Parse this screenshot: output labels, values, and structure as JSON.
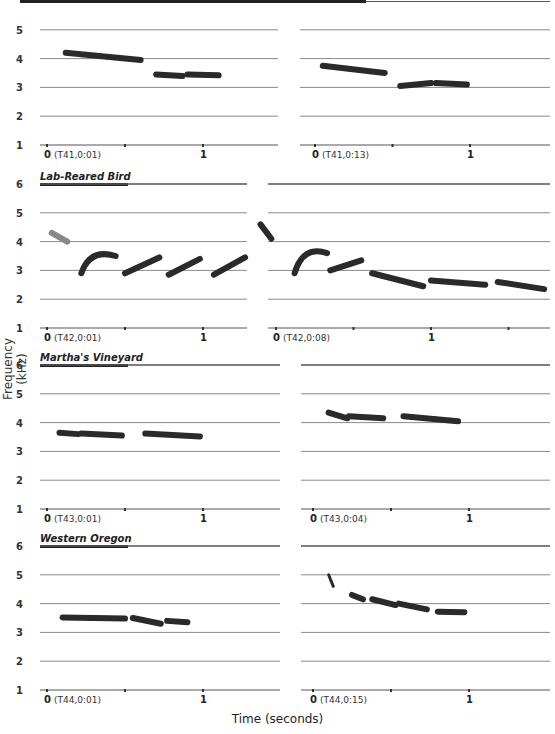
{
  "figure": {
    "ylabel": "Frequency (kHz)",
    "xlabel": "Time (seconds)",
    "colors": {
      "grid": "#8a8a8a",
      "note": "#2a2a2a",
      "header_bar": "#222222",
      "axis_line": "#555555"
    }
  },
  "chart_data": [
    {
      "type": "spectrogram",
      "row": 1,
      "group": "",
      "panels": [
        {
          "position": "left",
          "recording": "(T41,0:01)",
          "x_ticks": [
            "0",
            "1"
          ],
          "notes": [
            {
              "t0": 0.12,
              "t1": 0.6,
              "f0": 4.2,
              "f1": 3.95
            },
            {
              "t0": 0.7,
              "t1": 0.87,
              "f0": 3.45,
              "f1": 3.4
            },
            {
              "t0": 0.9,
              "t1": 1.1,
              "f0": 3.45,
              "f1": 3.42
            }
          ]
        },
        {
          "position": "right",
          "recording": "(T41,0:13)",
          "x_ticks": [
            "0",
            "1"
          ],
          "notes": [
            {
              "t0": 0.05,
              "t1": 0.45,
              "f0": 3.75,
              "f1": 3.5
            },
            {
              "t0": 0.55,
              "t1": 0.75,
              "f0": 3.05,
              "f1": 3.15
            },
            {
              "t0": 0.78,
              "t1": 0.98,
              "f0": 3.15,
              "f1": 3.1
            }
          ]
        }
      ],
      "y_ticks": [
        "1",
        "2",
        "3",
        "4",
        "5"
      ],
      "ylim": [
        1,
        6
      ]
    },
    {
      "type": "spectrogram",
      "row": 2,
      "group": "Lab-Reared Bird",
      "panels": [
        {
          "position": "left",
          "recording": "(T42,0:01)",
          "x_ticks": [
            "0",
            "1"
          ],
          "notes": [
            {
              "t0": 0.03,
              "t1": 0.13,
              "f0": 4.3,
              "f1": 4.0,
              "faint": true
            },
            {
              "t0": 0.22,
              "t1": 0.44,
              "f0": 2.9,
              "f1": 3.5,
              "arch": true
            },
            {
              "t0": 0.5,
              "t1": 0.72,
              "f0": 2.9,
              "f1": 3.45
            },
            {
              "t0": 0.78,
              "t1": 0.98,
              "f0": 2.85,
              "f1": 3.4
            },
            {
              "t0": 1.07,
              "t1": 1.27,
              "f0": 2.85,
              "f1": 3.45
            }
          ]
        },
        {
          "position": "right",
          "recording": "(T42,0:08)",
          "x_ticks": [
            "0",
            "1"
          ],
          "notes": [
            {
              "t0": -0.1,
              "t1": -0.03,
              "f0": 4.6,
              "f1": 4.1
            },
            {
              "t0": 0.12,
              "t1": 0.33,
              "f0": 2.9,
              "f1": 3.6,
              "arch": true
            },
            {
              "t0": 0.35,
              "t1": 0.55,
              "f0": 3.0,
              "f1": 3.35
            },
            {
              "t0": 0.62,
              "t1": 0.95,
              "f0": 2.9,
              "f1": 2.45
            },
            {
              "t0": 1.0,
              "t1": 1.35,
              "f0": 2.65,
              "f1": 2.5
            },
            {
              "t0": 1.43,
              "t1": 1.73,
              "f0": 2.6,
              "f1": 2.35
            }
          ]
        }
      ],
      "y_ticks": [
        "1",
        "2",
        "3",
        "4",
        "5",
        "6"
      ],
      "ylim": [
        1,
        6
      ]
    },
    {
      "type": "spectrogram",
      "row": 3,
      "group": "Martha's Vineyard",
      "panels": [
        {
          "position": "left",
          "recording": "(T43,0:01)",
          "x_ticks": [
            "0",
            "1"
          ],
          "notes": [
            {
              "t0": 0.08,
              "t1": 0.2,
              "f0": 3.65,
              "f1": 3.6
            },
            {
              "t0": 0.22,
              "t1": 0.48,
              "f0": 3.62,
              "f1": 3.55
            },
            {
              "t0": 0.63,
              "t1": 0.98,
              "f0": 3.62,
              "f1": 3.52
            }
          ]
        },
        {
          "position": "right",
          "recording": "(T43,0:04)",
          "x_ticks": [
            "0",
            "1"
          ],
          "notes": [
            {
              "t0": 0.1,
              "t1": 0.22,
              "f0": 4.35,
              "f1": 4.15
            },
            {
              "t0": 0.23,
              "t1": 0.45,
              "f0": 4.22,
              "f1": 4.15
            },
            {
              "t0": 0.58,
              "t1": 0.93,
              "f0": 4.22,
              "f1": 4.05
            }
          ]
        }
      ],
      "y_ticks": [
        "1",
        "2",
        "3",
        "4",
        "5",
        "6"
      ],
      "ylim": [
        1,
        6
      ]
    },
    {
      "type": "spectrogram",
      "row": 4,
      "group": "Western Oregon",
      "panels": [
        {
          "position": "left",
          "recording": "(T44,0:01)",
          "x_ticks": [
            "0",
            "1"
          ],
          "notes": [
            {
              "t0": 0.1,
              "t1": 0.5,
              "f0": 3.52,
              "f1": 3.48
            },
            {
              "t0": 0.55,
              "t1": 0.73,
              "f0": 3.5,
              "f1": 3.3
            },
            {
              "t0": 0.77,
              "t1": 0.9,
              "f0": 3.4,
              "f1": 3.35
            }
          ]
        },
        {
          "position": "right",
          "recording": "(T44,0:15)",
          "x_ticks": [
            "0",
            "1"
          ],
          "notes": [
            {
              "t0": 0.1,
              "t1": 0.13,
              "f0": 5.0,
              "f1": 4.6,
              "spike": true
            },
            {
              "t0": 0.25,
              "t1": 0.32,
              "f0": 4.3,
              "f1": 4.15
            },
            {
              "t0": 0.38,
              "t1": 0.53,
              "f0": 4.15,
              "f1": 3.95
            },
            {
              "t0": 0.55,
              "t1": 0.73,
              "f0": 4.0,
              "f1": 3.8
            },
            {
              "t0": 0.8,
              "t1": 0.97,
              "f0": 3.72,
              "f1": 3.7
            }
          ]
        }
      ],
      "y_ticks": [
        "1",
        "2",
        "3",
        "4",
        "5",
        "6"
      ],
      "ylim": [
        1,
        6
      ]
    }
  ]
}
